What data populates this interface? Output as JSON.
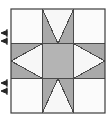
{
  "figure": {
    "title": "Sawtooth Star quilt block",
    "width": 111,
    "height": 121,
    "background_color": "#ffffff"
  },
  "block": {
    "name": "sawtooth-star-block",
    "label": "Sawtooth Star (Variable Star) pieced quilt block",
    "x": 11,
    "y": 9,
    "width": 94,
    "height": 104,
    "grid_columns": 3,
    "grid_rows": 3,
    "outline_color": "#3c3c3c",
    "outline_width": 1.2,
    "seam_line_color": "#4a4a4a",
    "seam_line_width": 1
  },
  "colors": {
    "background_fabric": "#f7f7f7",
    "corner_fabric": "#fbfbfb",
    "star_point_fabric": "#a9a9a9",
    "center_fabric": "#b4b4b4",
    "outline": "#3c3c3c",
    "seam_line": "#4a4a4a",
    "mark": "#262626"
  },
  "units": [
    {
      "name": "corner-square-top-left",
      "row": 0,
      "col": 0,
      "type": "plain-square",
      "fabric": "background_fabric"
    },
    {
      "name": "flying-geese-top",
      "row": 0,
      "col": 1,
      "type": "flying-geese",
      "point_direction": "down",
      "fabric": "star_point_fabric"
    },
    {
      "name": "corner-square-top-right",
      "row": 0,
      "col": 2,
      "type": "plain-square",
      "fabric": "background_fabric"
    },
    {
      "name": "flying-geese-left",
      "row": 1,
      "col": 0,
      "type": "flying-geese",
      "point_direction": "right",
      "fabric": "star_point_fabric"
    },
    {
      "name": "center-square",
      "row": 1,
      "col": 1,
      "type": "plain-square",
      "fabric": "center_fabric"
    },
    {
      "name": "flying-geese-right",
      "row": 1,
      "col": 2,
      "type": "flying-geese",
      "point_direction": "left",
      "fabric": "star_point_fabric"
    },
    {
      "name": "corner-square-bottom-left",
      "row": 2,
      "col": 0,
      "type": "plain-square",
      "fabric": "background_fabric"
    },
    {
      "name": "flying-geese-bottom",
      "row": 2,
      "col": 1,
      "type": "flying-geese",
      "point_direction": "up",
      "fabric": "star_point_fabric"
    },
    {
      "name": "corner-square-bottom-right",
      "row": 2,
      "col": 2,
      "type": "plain-square",
      "fabric": "background_fabric"
    }
  ],
  "edge_marks": {
    "name": "left-edge-seam-marks",
    "description": "Paired arrow tick marks on the left margin indicating seam alignment",
    "color": "#262626",
    "groups": [
      {
        "name": "seam-mark-upper",
        "x": 3,
        "y": 33,
        "arrows": 2
      },
      {
        "name": "seam-mark-lower",
        "x": 3,
        "y": 83,
        "arrows": 2
      }
    ]
  }
}
